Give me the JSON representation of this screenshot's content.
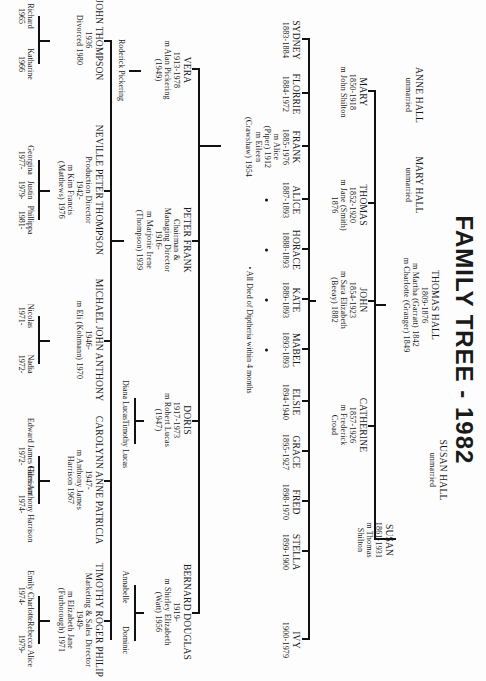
{
  "title": "FAMILY TREE - 1982",
  "generation1": {
    "anne": {
      "name": "ANNE HALL",
      "note": "unmarried"
    },
    "mary": {
      "name": "MARY HALL",
      "note": "unmarried"
    },
    "thomas": {
      "name": "THOMAS HALL",
      "dates": "1809-1876",
      "m1": "m Martha (Garratt) 1842",
      "m2": "m Charlotte (Granger) 1849"
    },
    "susan": {
      "name": "SUSAN HALL",
      "note": "unmarried"
    }
  },
  "generation2": [
    {
      "name": "MARY",
      "dates": "1850-1918",
      "spouse": "m John Shilton"
    },
    {
      "name": "THOMAS",
      "dates": "1852-1920",
      "spouse": "m Jane (Smith)",
      "extra": "1876"
    },
    {
      "name": "JOHN",
      "dates": "1854-1923",
      "spouse": "m Sara Elizabeth",
      "extra": "(Beeay) 1882"
    },
    {
      "name": "CATHERINE",
      "dates": "1857-1926",
      "spouse": "m Frederick",
      "extra": "Croad"
    },
    {
      "name": "SUSAN",
      "dates": "1861-1931",
      "spouse": "m Thomas",
      "extra": "Shilton"
    }
  ],
  "generation3": [
    {
      "name": "SYDNEY",
      "dates": "1883-1884"
    },
    {
      "name": "FLORRIE",
      "dates": "1884-1972"
    },
    {
      "name": "FRANK",
      "dates": "1885-1976",
      "spouse1": "m Alice",
      "spouse1b": "(Piper) 1912",
      "spouse2": "m Eileen",
      "spouse2b": "(Crawshaw) 1954"
    },
    {
      "name": "ALICE",
      "dates": "1887-1893",
      "died_diphtheria": true
    },
    {
      "name": "HORACE",
      "dates": "1888-1893",
      "died_diphtheria": true
    },
    {
      "name": "KATE",
      "dates": "1889-1893",
      "died_diphtheria": true
    },
    {
      "name": "MABEL",
      "dates": "1893-1893",
      "died_diphtheria": true
    },
    {
      "name": "ELSIE",
      "dates": "1894-1940"
    },
    {
      "name": "GRACE",
      "dates": "1895-1927"
    },
    {
      "name": "FRED",
      "dates": "1898-1970"
    },
    {
      "name": "STELLA",
      "dates": "1899-1900"
    },
    {
      "name": "IVY",
      "dates": "1900-1979"
    }
  ],
  "footnote": "• All Died of Diptheria within 4 months",
  "generation4": [
    {
      "name": "VERA",
      "dates": "1913-1978",
      "spouse": "m Alan Pickering",
      "extra": "(1949)",
      "children": [
        "Roderick Pickering"
      ]
    },
    {
      "name": "PETER FRANK",
      "role1": "Chairman &",
      "role2": "Managing Director",
      "dates": "1916-",
      "spouse": "m Marjorie Irene",
      "extra": "(Thompson) 1939"
    },
    {
      "name": "DORIS",
      "dates": "1917-1973",
      "spouse": "m Robert Lucas",
      "extra": "(1947)",
      "children": [
        "Diana Lucas",
        "Timothy Lucas"
      ]
    },
    {
      "name": "BERNARD DOUGLAS",
      "dates": "1919-",
      "spouse": "m Shirley Elizabeth",
      "extra": "(Watt) 1956",
      "children": [
        "Annabelle",
        "Dominic"
      ]
    }
  ],
  "generation5": [
    {
      "name": "JOHN THOMPSON",
      "dates": "1936",
      "note": "Divorced 1980",
      "children": [
        {
          "name": "Richard",
          "year": "1965"
        },
        {
          "name": "Katharine",
          "year": "1966"
        }
      ]
    },
    {
      "name": "NEVILLE PETER THOMPSON",
      "role": "Production Director",
      "dates": "1942-",
      "spouse": "m Kim Francis",
      "extra": "(Matthews) 1976",
      "children": [
        {
          "name": "Georgina",
          "year": "1977-"
        },
        {
          "name": "Justin",
          "year": "1979-"
        },
        {
          "name": "Phillippa",
          "year": "1981-"
        }
      ]
    },
    {
      "name": "MICHAEL JOHN ANTHONY",
      "dates": "1946-",
      "spouse": "m Eli (Kohmann) 1970",
      "children": [
        {
          "name": "Nicolas",
          "year": "1971-"
        },
        {
          "name": "Nadia",
          "year": "1972-"
        }
      ]
    },
    {
      "name": "CAROLYNN ANNE PATRICIA",
      "dates": "1947-",
      "spouse": "m Anthony James",
      "extra": "Harrison 1967",
      "children": [
        {
          "name": "Edward James Harrison",
          "year": "1972-"
        },
        {
          "name": "Giles Anthony Harrison",
          "year": "1974-"
        }
      ]
    },
    {
      "name": "TIMOTHY ROGER PHILIP",
      "role": "Marketing & Sales Director",
      "dates": "1949-",
      "spouse": "m Elizabeth Jane",
      "extra": "(Furborough) 1971",
      "children": [
        {
          "name": "Emily Charlotte",
          "year": "1974-"
        },
        {
          "name": "Rebecca Alice",
          "year": "1979-"
        }
      ]
    }
  ]
}
